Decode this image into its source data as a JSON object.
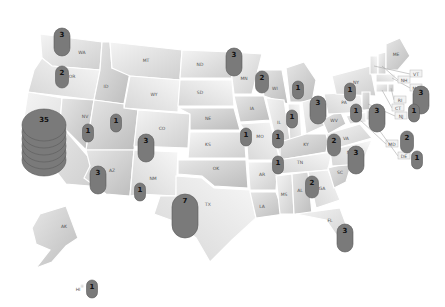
{
  "chart_data": {
    "type": "map",
    "title": "",
    "region": "United States",
    "encoding": "stacked 3D cylinder markers showing count per state",
    "states": [
      {
        "abbr": "WA",
        "value": 3
      },
      {
        "abbr": "OR",
        "value": 2
      },
      {
        "abbr": "CA",
        "value": 35
      },
      {
        "abbr": "NV",
        "value": 1
      },
      {
        "abbr": "ID",
        "value": null
      },
      {
        "abbr": "MT",
        "value": null
      },
      {
        "abbr": "WY",
        "value": null
      },
      {
        "abbr": "UT",
        "value": 1
      },
      {
        "abbr": "CO",
        "value": 3
      },
      {
        "abbr": "AZ",
        "value": 3
      },
      {
        "abbr": "NM",
        "value": 1
      },
      {
        "abbr": "ND",
        "value": null
      },
      {
        "abbr": "SD",
        "value": null
      },
      {
        "abbr": "NE",
        "value": null
      },
      {
        "abbr": "KS",
        "value": null
      },
      {
        "abbr": "OK",
        "value": null
      },
      {
        "abbr": "TX",
        "value": 7
      },
      {
        "abbr": "MN",
        "value": 3
      },
      {
        "abbr": "IA",
        "value": null
      },
      {
        "abbr": "MO",
        "value": 1
      },
      {
        "abbr": "AR",
        "value": null
      },
      {
        "abbr": "LA",
        "value": null
      },
      {
        "abbr": "WI",
        "value": 2
      },
      {
        "abbr": "IL",
        "value": 1
      },
      {
        "abbr": "IN",
        "value": 1
      },
      {
        "abbr": "MI",
        "value": 1
      },
      {
        "abbr": "OH",
        "value": 3
      },
      {
        "abbr": "KY",
        "value": null
      },
      {
        "abbr": "TN",
        "value": 1
      },
      {
        "abbr": "MS",
        "value": null
      },
      {
        "abbr": "AL",
        "value": null
      },
      {
        "abbr": "GA",
        "value": 2
      },
      {
        "abbr": "FL",
        "value": 3
      },
      {
        "abbr": "SC",
        "value": null
      },
      {
        "abbr": "NC",
        "value": 3
      },
      {
        "abbr": "VA",
        "value": 2
      },
      {
        "abbr": "WV",
        "value": null
      },
      {
        "abbr": "PA",
        "value": 1
      },
      {
        "abbr": "NY",
        "value": 1
      },
      {
        "abbr": "NJ",
        "value": 3
      },
      {
        "abbr": "MA",
        "value": 3
      },
      {
        "abbr": "CT",
        "value": 1
      },
      {
        "abbr": "RI",
        "value": null
      },
      {
        "abbr": "VT",
        "value": null
      },
      {
        "abbr": "NH",
        "value": null
      },
      {
        "abbr": "ME",
        "value": null
      },
      {
        "abbr": "MD",
        "value": 2
      },
      {
        "abbr": "DE",
        "value": 1
      },
      {
        "abbr": "AK",
        "value": null
      },
      {
        "abbr": "HI",
        "value": 1
      }
    ],
    "callout_labels": [
      "VT",
      "NH",
      "MA",
      "RI",
      "CT",
      "NJ",
      "MD",
      "DE"
    ]
  }
}
